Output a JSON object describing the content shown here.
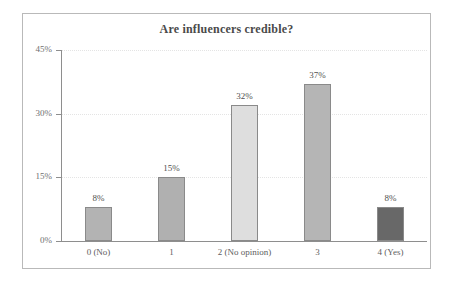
{
  "chart_data": {
    "type": "bar",
    "title": "Are influencers credible?",
    "xlabel": "",
    "ylabel": "",
    "categories": [
      "0 (No)",
      "1",
      "2 (No opinion)",
      "3",
      "4 (Yes)"
    ],
    "values": [
      8,
      15,
      32,
      37,
      8
    ],
    "value_labels": [
      "8%",
      "15%",
      "32%",
      "37%",
      "8%"
    ],
    "ylim": [
      0,
      45
    ],
    "y_ticks": [
      0,
      15,
      30,
      45
    ],
    "y_tick_labels": [
      "0%",
      "15%",
      "30%",
      "45%"
    ],
    "grid": true,
    "legend": false,
    "bar_colors": [
      "#b3b3b3",
      "#b0b0b0",
      "#dedede",
      "#b5b5b5",
      "#686868"
    ],
    "bar_border_color": "#8a8a8a",
    "axis_color": "#8e8e8e",
    "frame_color": "#b9b9b9",
    "title_color": "#4a4a4a",
    "background": "#ffffff"
  }
}
